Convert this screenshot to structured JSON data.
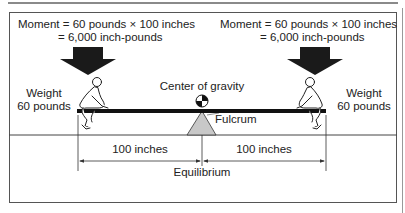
{
  "diagram": {
    "type": "seesaw-moment-equilibrium",
    "left": {
      "moment_line1": "Moment = 60 pounds × 100 inches",
      "moment_line2": "= 6,000 inch-pounds",
      "weight_line1": "Weight",
      "weight_line2": "60 pounds",
      "distance": "100 inches"
    },
    "right": {
      "moment_line1": "Moment = 60 pounds × 100 inches",
      "moment_line2": "= 6,000 inch-pounds",
      "weight_line1": "Weight",
      "weight_line2": "60 pounds",
      "distance": "100 inches"
    },
    "center_of_gravity_label": "Center of gravity",
    "fulcrum_label": "Fulcrum",
    "equilibrium_label": "Equilibrium",
    "colors": {
      "beam": "#111111",
      "arrow": "#1a1a1a",
      "fulcrum_fill": "#c8c8c8",
      "frame": "#555555"
    }
  }
}
